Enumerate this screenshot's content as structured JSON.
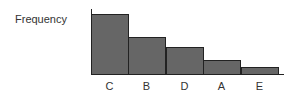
{
  "chart_data": {
    "type": "bar",
    "title": "",
    "xlabel": "",
    "ylabel": "Frequency",
    "categories": [
      "C",
      "B",
      "D",
      "A",
      "E"
    ],
    "values": [
      8,
      5,
      3.7,
      2,
      1
    ],
    "ylim": [
      0,
      8.6
    ],
    "grid": false,
    "legend": null,
    "bar_color": "#666666"
  },
  "labels": {
    "ylabel": "Frequency"
  }
}
